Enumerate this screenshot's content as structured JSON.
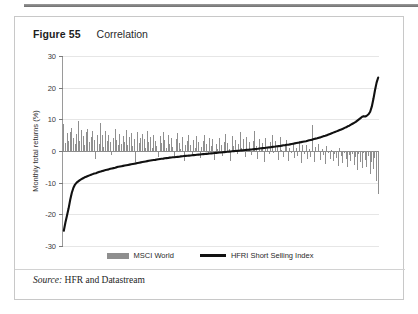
{
  "figure": {
    "number": "Figure 55",
    "caption": "Correlation",
    "source_word": "Source:",
    "source_text": "HFR and Datastream"
  },
  "legend": {
    "position": "bottom-center",
    "items": [
      {
        "label": "MSCI World",
        "marker": "bar",
        "color": "#8f8f8f"
      },
      {
        "label": "HFRI Short Selling Index",
        "marker": "line",
        "color": "#111111"
      }
    ]
  },
  "colors": {
    "bar": "#8f8f8f",
    "line": "#111111",
    "grid": "#e6e6e6",
    "axis": "#9a9a9a",
    "frame": "#c8c8c8"
  },
  "chart_data": {
    "type": "bar",
    "title": "Correlation",
    "subtitle": "",
    "xlabel": "",
    "ylabel": "Monthly total returns (%)",
    "ylim": [
      -30,
      30
    ],
    "yticks": [
      30,
      20,
      10,
      0,
      -10,
      -20,
      -30
    ],
    "ytick_labels": [
      "30",
      "20",
      "10",
      "0",
      "-10",
      "-20",
      "-30"
    ],
    "xaxis_visible": false,
    "xticks": [],
    "grid": true,
    "legend": [
      "MSCI World",
      "HFRI Short Selling Index"
    ],
    "note": "Monthly observations sorted ascending by HFRI Short Selling Index return; MSCI World bars shown for the same months, illustrating inverse correlation.",
    "series": [
      {
        "name": "HFRI Short Selling Index",
        "type": "line",
        "color": "#111111",
        "values": [
          -25.2,
          -22.6,
          -20.4,
          -18.1,
          -15.4,
          -13.2,
          -11.6,
          -10.6,
          -10.0,
          -9.6,
          -9.2,
          -8.9,
          -8.6,
          -8.3,
          -8.1,
          -7.9,
          -7.7,
          -7.5,
          -7.3,
          -7.1,
          -7.0,
          -6.8,
          -6.6,
          -6.5,
          -6.3,
          -6.2,
          -6.0,
          -5.9,
          -5.8,
          -5.6,
          -5.5,
          -5.4,
          -5.3,
          -5.1,
          -5.0,
          -4.9,
          -4.8,
          -4.7,
          -4.6,
          -4.5,
          -4.4,
          -4.3,
          -4.2,
          -4.1,
          -4.0,
          -3.9,
          -3.8,
          -3.7,
          -3.6,
          -3.5,
          -3.4,
          -3.3,
          -3.2,
          -3.1,
          -3.0,
          -2.9,
          -2.85,
          -2.8,
          -2.7,
          -2.6,
          -2.5,
          -2.45,
          -2.4,
          -2.3,
          -2.25,
          -2.2,
          -2.1,
          -2.05,
          -2.0,
          -1.95,
          -1.9,
          -1.85,
          -1.8,
          -1.7,
          -1.65,
          -1.6,
          -1.55,
          -1.5,
          -1.45,
          -1.4,
          -1.35,
          -1.3,
          -1.25,
          -1.2,
          -1.15,
          -1.1,
          -1.05,
          -1.0,
          -0.95,
          -0.9,
          -0.85,
          -0.8,
          -0.75,
          -0.7,
          -0.65,
          -0.6,
          -0.55,
          -0.5,
          -0.45,
          -0.4,
          -0.35,
          -0.3,
          -0.25,
          -0.2,
          -0.15,
          -0.1,
          -0.05,
          0.0,
          0.05,
          0.1,
          0.15,
          0.2,
          0.25,
          0.3,
          0.35,
          0.4,
          0.45,
          0.5,
          0.55,
          0.6,
          0.65,
          0.7,
          0.8,
          0.85,
          0.9,
          0.95,
          1.0,
          1.1,
          1.15,
          1.2,
          1.3,
          1.35,
          1.4,
          1.5,
          1.55,
          1.6,
          1.7,
          1.8,
          1.85,
          1.95,
          2.0,
          2.1,
          2.2,
          2.3,
          2.4,
          2.5,
          2.6,
          2.7,
          2.8,
          2.9,
          3.0,
          3.1,
          3.25,
          3.4,
          3.5,
          3.6,
          3.8,
          3.9,
          4.0,
          4.2,
          4.3,
          4.5,
          4.7,
          4.8,
          5.0,
          5.2,
          5.4,
          5.6,
          5.8,
          6.0,
          6.2,
          6.4,
          6.6,
          6.8,
          7.0,
          7.3,
          7.5,
          7.8,
          8.0,
          8.3,
          8.6,
          8.9,
          9.2,
          9.6,
          10.0,
          10.4,
          10.8,
          11.0,
          10.9,
          11.2,
          11.6,
          12.4,
          14.0,
          16.4,
          19.2,
          21.6,
          23.2
        ]
      },
      {
        "name": "MSCI World",
        "type": "bar",
        "color": "#8f8f8f",
        "values": [
          8.6,
          2.4,
          5.6,
          3.2,
          6.1,
          7.4,
          4.2,
          2.1,
          5.3,
          9.4,
          3.1,
          6.7,
          4.6,
          1.8,
          5.9,
          7.1,
          2.7,
          4.4,
          6.2,
          3.6,
          -2.6,
          5.1,
          2.2,
          8.8,
          4.9,
          1.4,
          6.4,
          3.3,
          5.2,
          2.8,
          -1.2,
          4.1,
          6.9,
          3.4,
          1.9,
          5.5,
          2.3,
          4.8,
          3.0,
          6.6,
          2.0,
          4.3,
          5.8,
          1.6,
          3.7,
          -3.4,
          6.0,
          2.5,
          4.0,
          5.4,
          3.8,
          1.1,
          6.3,
          2.9,
          4.5,
          0.9,
          5.0,
          3.2,
          1.5,
          -1.9,
          4.7,
          2.6,
          6.1,
          3.5,
          0.8,
          5.2,
          2.2,
          4.1,
          1.3,
          -2.1,
          3.9,
          5.7,
          2.4,
          0.6,
          4.4,
          -3.0,
          1.8,
          3.1,
          5.0,
          2.0,
          -1.4,
          3.6,
          0.9,
          4.6,
          2.7,
          -2.3,
          1.2,
          3.3,
          5.1,
          2.1,
          -0.7,
          4.0,
          1.5,
          3.8,
          -2.8,
          2.3,
          0.5,
          4.2,
          1.9,
          -1.6,
          3.0,
          5.3,
          2.6,
          0.7,
          -3.2,
          4.8,
          1.7,
          3.4,
          -0.9,
          2.2,
          5.9,
          1.0,
          3.7,
          -2.0,
          4.3,
          0.4,
          2.8,
          -1.3,
          3.1,
          6.4,
          1.6,
          -2.5,
          3.9,
          0.8,
          2.4,
          -3.6,
          4.1,
          1.2,
          -1.1,
          2.9,
          5.2,
          -0.6,
          3.3,
          1.4,
          -2.7,
          4.5,
          0.3,
          -1.8,
          2.1,
          3.6,
          -3.1,
          1.1,
          -0.5,
          2.5,
          -2.2,
          0.9,
          -1.5,
          3.2,
          -3.8,
          1.8,
          -0.8,
          2.0,
          -2.4,
          0.6,
          -1.9,
          8.2,
          -3.5,
          1.3,
          -0.4,
          2.3,
          -2.9,
          0.7,
          -1.2,
          -4.2,
          1.5,
          -0.6,
          -2.6,
          0.4,
          -3.3,
          -1.0,
          -2.1,
          -4.6,
          0.9,
          -1.7,
          -3.9,
          -0.5,
          -2.4,
          -5.2,
          -1.3,
          -3.1,
          -0.8,
          -4.4,
          -2.0,
          -6.1,
          -1.1,
          -3.6,
          -5.4,
          -0.7,
          -2.8,
          -4.9,
          -1.6,
          -7.2,
          -3.4,
          -5.8,
          -2.2,
          -9.4,
          -13.6
        ]
      }
    ]
  }
}
